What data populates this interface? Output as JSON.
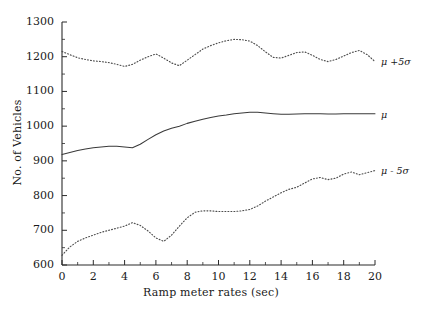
{
  "chart_data": {
    "type": "line",
    "title": "",
    "subtitle": "",
    "xlabel": "Ramp meter rates  (sec)",
    "ylabel": "No. of Vehicles",
    "xlim": [
      0,
      20
    ],
    "ylim": [
      600,
      1300
    ],
    "xticks": [
      0,
      2,
      4,
      6,
      8,
      10,
      12,
      14,
      16,
      18,
      20
    ],
    "xtick_labels": [
      "0",
      "2",
      "4",
      "6",
      "8",
      "10",
      "12",
      "14",
      "16",
      "18",
      "20"
    ],
    "x_minor_step": 1,
    "yticks": [
      600,
      700,
      800,
      900,
      1000,
      1100,
      1200,
      1300
    ],
    "ytick_labels": [
      "600",
      "700",
      "800",
      "900",
      "1000",
      "1100",
      "1200",
      "1300"
    ],
    "y_minor_step": 50,
    "grid": false,
    "legend_position": "inline-right",
    "x": [
      0,
      0.5,
      1,
      1.5,
      2,
      2.5,
      3,
      3.5,
      4,
      4.5,
      5,
      5.5,
      6,
      6.5,
      7,
      7.5,
      8,
      8.5,
      9,
      9.5,
      10,
      10.5,
      11,
      11.5,
      12,
      12.5,
      13,
      13.5,
      14,
      14.5,
      15,
      15.5,
      16,
      16.5,
      17,
      17.5,
      18,
      18.5,
      19,
      19.5,
      20
    ],
    "series": [
      {
        "name": "mu-plus-5-sigma",
        "label": "μ +5σ",
        "style": "dotted",
        "color": "#4d4d4d",
        "values": [
          1215,
          1206,
          1197,
          1192,
          1188,
          1186,
          1183,
          1178,
          1172,
          1178,
          1190,
          1200,
          1208,
          1196,
          1182,
          1174,
          1190,
          1206,
          1222,
          1232,
          1240,
          1246,
          1250,
          1249,
          1245,
          1232,
          1214,
          1198,
          1196,
          1204,
          1212,
          1214,
          1204,
          1192,
          1186,
          1192,
          1202,
          1212,
          1218,
          1206,
          1186
        ]
      },
      {
        "name": "mu",
        "label": "μ",
        "style": "solid",
        "color": "#3a3a3a",
        "values": [
          918,
          924,
          930,
          934,
          938,
          940,
          942,
          942,
          940,
          938,
          948,
          962,
          975,
          986,
          994,
          1000,
          1008,
          1014,
          1020,
          1025,
          1029,
          1032,
          1036,
          1038,
          1040,
          1040,
          1038,
          1036,
          1034,
          1034,
          1035,
          1036,
          1036,
          1036,
          1035,
          1035,
          1036,
          1036,
          1036,
          1036,
          1036
        ]
      },
      {
        "name": "mu-minus-5-sigma",
        "label": "μ - 5σ",
        "style": "dotted",
        "color": "#4d4d4d",
        "values": [
          628,
          652,
          668,
          678,
          686,
          694,
          700,
          706,
          712,
          722,
          714,
          698,
          678,
          668,
          686,
          712,
          736,
          752,
          756,
          756,
          754,
          754,
          754,
          756,
          760,
          770,
          784,
          796,
          808,
          818,
          824,
          836,
          848,
          852,
          846,
          850,
          862,
          868,
          860,
          866,
          872
        ]
      }
    ],
    "series_labels": [
      {
        "name": "mu-plus-5-sigma",
        "text": "μ +5σ"
      },
      {
        "name": "mu",
        "text": "μ"
      },
      {
        "name": "mu-minus-5-sigma",
        "text": "μ - 5σ"
      }
    ]
  },
  "axes": {
    "ylabel": "No. of Vehicles",
    "xlabel": "Ramp meter rates  (sec)"
  }
}
